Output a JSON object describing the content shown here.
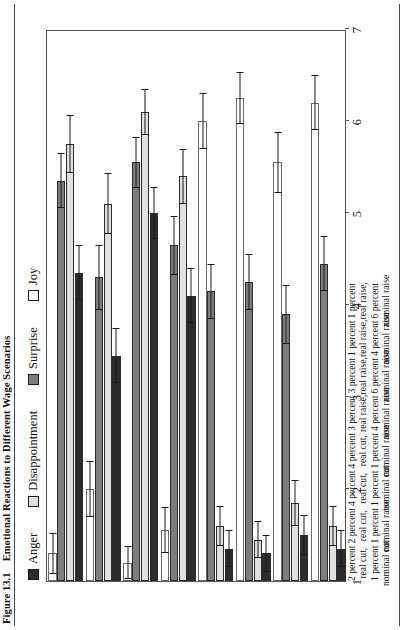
{
  "figure": {
    "number": "Figure 13.1",
    "title": "Emotional Reactions to Different Wage Scenarios"
  },
  "legend": {
    "position": "top-left",
    "items": [
      {
        "label": "Anger",
        "color": "#2b2b2b"
      },
      {
        "label": "Disappointment",
        "color": "#e0e0e0"
      },
      {
        "label": "Surprise",
        "color": "#7d7d7d"
      },
      {
        "label": "Joy",
        "color": "#ffffff"
      }
    ]
  },
  "axis": {
    "value_ticks": [
      "1",
      "2",
      "3",
      "4",
      "5",
      "6",
      "7"
    ],
    "min": 1,
    "max": 7
  },
  "categories": [
    {
      "lines": [
        "2 percent",
        "real cut,",
        "1 percent",
        "nominal cut"
      ]
    },
    {
      "lines": [
        "2 percent",
        "real cut,",
        "1 percent",
        "nominal raise"
      ]
    },
    {
      "lines": [
        "4 percent",
        "real cut,",
        "1 percent",
        "nominal cut"
      ]
    },
    {
      "lines": [
        "4 percent",
        "real cut,",
        "1 percent",
        "nominal raise"
      ]
    },
    {
      "lines": [
        "3 percent",
        "real raise,",
        "4 percent",
        "nominal raise"
      ]
    },
    {
      "lines": [
        "3 percent",
        "real raise,",
        "6 percent",
        "nominal raise"
      ]
    },
    {
      "lines": [
        "1 percent",
        "real raise,",
        "4 percent",
        "nominal raise"
      ]
    },
    {
      "lines": [
        "1 percent",
        "real raise,",
        "6 percent",
        "nominal raise"
      ]
    }
  ],
  "chart_data": {
    "type": "bar",
    "orientation": "horizontal",
    "title": "Emotional Reactions to Different Wage Scenarios",
    "xlabel": "",
    "ylabel": "",
    "ylim": [
      1,
      7
    ],
    "grid": false,
    "legend_position": "top-left",
    "categories": [
      "2 percent real cut, 1 percent nominal cut",
      "2 percent real cut, 1 percent nominal raise",
      "4 percent real cut, 1 percent nominal cut",
      "4 percent real cut, 1 percent nominal raise",
      "3 percent real raise, 4 percent nominal raise",
      "3 percent real raise, 6 percent nominal raise",
      "1 percent real raise, 4 percent nominal raise",
      "1 percent real raise, 6 percent nominal raise"
    ],
    "series": [
      {
        "name": "Anger",
        "color": "#2b2b2b",
        "values": [
          4.35,
          3.45,
          5.0,
          4.1,
          1.35,
          1.3,
          1.5,
          1.35
        ],
        "errors": [
          0.3,
          0.3,
          0.28,
          0.3,
          0.2,
          0.2,
          0.22,
          0.2
        ]
      },
      {
        "name": "Disappointment",
        "color": "#e0e0e0",
        "values": [
          5.75,
          5.1,
          6.1,
          5.4,
          1.6,
          1.45,
          1.85,
          1.6
        ],
        "errors": [
          0.32,
          0.33,
          0.25,
          0.3,
          0.22,
          0.2,
          0.25,
          0.22
        ]
      },
      {
        "name": "Surprise",
        "color": "#7d7d7d",
        "values": [
          5.35,
          4.3,
          5.55,
          4.65,
          4.15,
          4.25,
          3.9,
          4.45
        ],
        "errors": [
          0.3,
          0.35,
          0.28,
          0.32,
          0.3,
          0.3,
          0.32,
          0.3
        ]
      },
      {
        "name": "Joy",
        "color": "#ffffff",
        "values": [
          1.3,
          2.0,
          1.2,
          1.55,
          6.0,
          6.25,
          5.55,
          6.2
        ],
        "errors": [
          0.22,
          0.3,
          0.18,
          0.25,
          0.3,
          0.28,
          0.33,
          0.3
        ]
      }
    ]
  }
}
